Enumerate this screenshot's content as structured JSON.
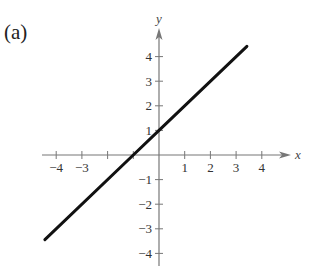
{
  "panel_label": "(a)",
  "chart_data": {
    "type": "line",
    "title": "",
    "panel": "(a)",
    "xlabel": "x",
    "ylabel": "y",
    "xlim": [
      -4.5,
      4.9
    ],
    "ylim": [
      -4.5,
      5.1
    ],
    "grid": false,
    "legend": null,
    "x_ticks": [
      -4,
      -3,
      -2,
      -1,
      1,
      2,
      3,
      4
    ],
    "x_tick_labels": [
      "−4",
      "−3",
      "",
      "",
      "1",
      "2",
      "3",
      "4"
    ],
    "y_ticks": [
      -4,
      -3,
      -2,
      -1,
      1,
      2,
      3,
      4
    ],
    "y_tick_labels": [
      "−4",
      "−3",
      "−2",
      "−1",
      "1",
      "2",
      "3",
      "4"
    ],
    "series": [
      {
        "name": "y = x + 1",
        "equation": "y = x + 1",
        "slope": 1,
        "intercept": 1,
        "x": [
          -4.44,
          -1,
          0,
          3.42
        ],
        "y": [
          -3.44,
          0,
          1,
          4.42
        ],
        "color": "#111111"
      }
    ],
    "colors": {
      "axis": "#777777",
      "line": "#111111",
      "text": "#333333"
    }
  }
}
